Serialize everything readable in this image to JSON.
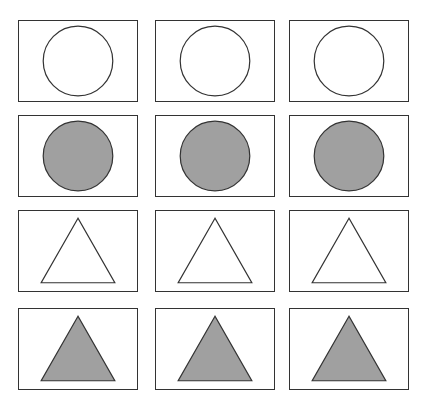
{
  "grid": {
    "rows": 4,
    "columns": 3,
    "colors": {
      "stroke": "#333333",
      "filled": "#a0a0a0",
      "empty": "#ffffff"
    },
    "row_items": [
      {
        "shape": "circle",
        "fill": "empty"
      },
      {
        "shape": "circle",
        "fill": "filled"
      },
      {
        "shape": "triangle",
        "fill": "empty"
      },
      {
        "shape": "triangle",
        "fill": "filled"
      }
    ]
  }
}
